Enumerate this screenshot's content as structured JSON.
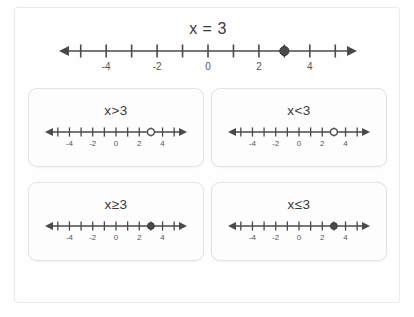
{
  "figure": {
    "background_color": "#ffffff",
    "frame_color": "#fefefe",
    "ink_color": "#4a4a4a",
    "text_color": "#3a3a3a"
  },
  "main": {
    "label": "x = 3",
    "number_line": {
      "min": -5.5,
      "max": 5.5,
      "tick_min": -5,
      "tick_max": 5,
      "tick_step": 1,
      "tick_labels": [
        "-4",
        "-2",
        "0",
        "2",
        "4"
      ],
      "tick_label_values": [
        -4,
        -2,
        0,
        2,
        4
      ],
      "point_value": 3,
      "point_style": "closed",
      "left_arrow": true,
      "right_arrow": true,
      "shading": "none"
    }
  },
  "panels": [
    {
      "label": "x>3",
      "number_line": {
        "min": -5.5,
        "max": 5.5,
        "tick_min": -5,
        "tick_max": 5,
        "tick_step": 1,
        "tick_labels": [
          "-4",
          "-2",
          "0",
          "2",
          "4"
        ],
        "tick_label_values": [
          -4,
          -2,
          0,
          2,
          4
        ],
        "point_value": 3,
        "point_style": "open",
        "left_arrow": true,
        "right_arrow": true,
        "shading": "none"
      }
    },
    {
      "label": "x<3",
      "number_line": {
        "min": -5.5,
        "max": 5.5,
        "tick_min": -5,
        "tick_max": 5,
        "tick_step": 1,
        "tick_labels": [
          "-4",
          "-2",
          "0",
          "2",
          "4"
        ],
        "tick_label_values": [
          -4,
          -2,
          0,
          2,
          4
        ],
        "point_value": 3,
        "point_style": "open",
        "left_arrow": true,
        "right_arrow": true,
        "shading": "none"
      }
    },
    {
      "label": "x≥3",
      "number_line": {
        "min": -5.5,
        "max": 5.5,
        "tick_min": -5,
        "tick_max": 5,
        "tick_step": 1,
        "tick_labels": [
          "-4",
          "-2",
          "0",
          "2",
          "4"
        ],
        "tick_label_values": [
          -4,
          -2,
          0,
          2,
          4
        ],
        "point_value": 3,
        "point_style": "closed",
        "left_arrow": true,
        "right_arrow": true,
        "shading": "none"
      }
    },
    {
      "label": "x≤3",
      "number_line": {
        "min": -5.5,
        "max": 5.5,
        "tick_min": -5,
        "tick_max": 5,
        "tick_step": 1,
        "tick_labels": [
          "-4",
          "-2",
          "0",
          "2",
          "4"
        ],
        "tick_label_values": [
          -4,
          -2,
          0,
          2,
          4
        ],
        "point_value": 3,
        "point_style": "closed",
        "left_arrow": true,
        "right_arrow": true,
        "shading": "none"
      }
    }
  ],
  "chart_data": {
    "type": "line",
    "title": "x = 3",
    "xlabel": "",
    "ylabel": "",
    "xlim": [
      -5.5,
      5.5
    ],
    "grid": false,
    "legend": "none",
    "series": [
      {
        "name": "x = 3",
        "point": 3,
        "marker": "closed",
        "categories": [
          -4,
          -2,
          0,
          2,
          4
        ]
      },
      {
        "name": "x>3",
        "point": 3,
        "marker": "open",
        "categories": [
          -4,
          -2,
          0,
          2,
          4
        ]
      },
      {
        "name": "x<3",
        "point": 3,
        "marker": "open",
        "categories": [
          -4,
          -2,
          0,
          2,
          4
        ]
      },
      {
        "name": "x≥3",
        "point": 3,
        "marker": "closed",
        "categories": [
          -4,
          -2,
          0,
          2,
          4
        ]
      },
      {
        "name": "x≤3",
        "point": 3,
        "marker": "closed",
        "categories": [
          -4,
          -2,
          0,
          2,
          4
        ]
      }
    ]
  }
}
